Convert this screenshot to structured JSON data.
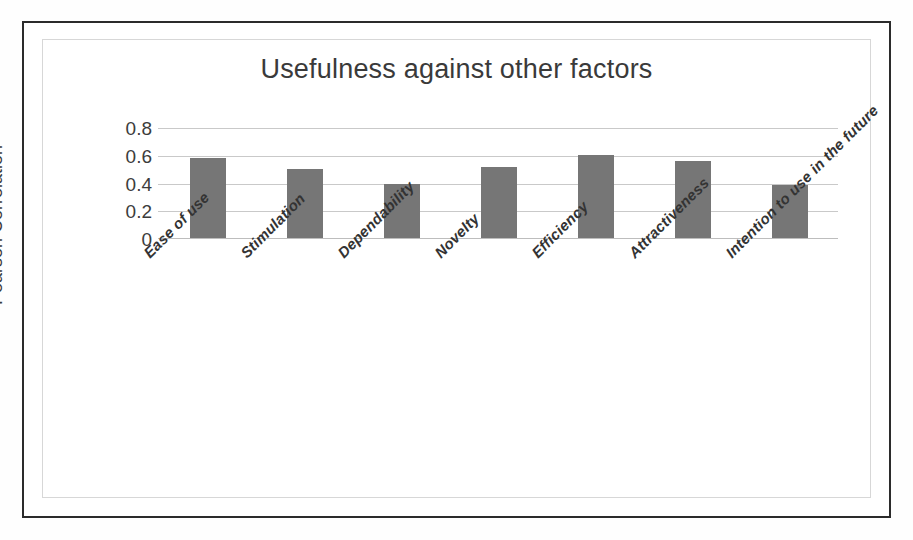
{
  "figure": {
    "outer_border_color": "#2b2b2b",
    "inner_border_color": "#d7d7d7",
    "background_color": "#ffffff"
  },
  "chart_data": {
    "type": "bar",
    "title": "Usefulness against other factors",
    "xlabel": "",
    "ylabel": "Pearson Correlation",
    "categories": [
      "Ease of use",
      "Stimulation",
      "Dependability",
      "Novelty",
      "Efficiency",
      "Attractiveness",
      "Intention to use in the future"
    ],
    "values": [
      0.585,
      0.505,
      0.4,
      0.52,
      0.605,
      0.56,
      0.39
    ],
    "ylim": [
      0,
      0.8
    ],
    "yticks": [
      "0",
      "0.2",
      "0.4",
      "0.6",
      "0.8"
    ],
    "ytick_values": [
      0,
      0.2,
      0.4,
      0.6,
      0.8
    ],
    "grid": true,
    "legend": false,
    "bar_color": "#767676",
    "gridline_color": "#c9c9c9",
    "series_name": "Usefulness"
  }
}
